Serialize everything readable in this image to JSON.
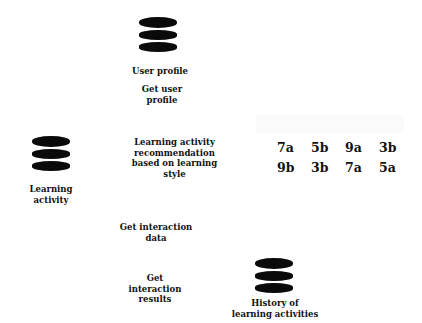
{
  "nodes": {
    "user_profile": {
      "label": "User profile"
    },
    "learning_activity": {
      "label": "Learning activity"
    },
    "history": {
      "label_line1": "History of",
      "label_line2": "learning activities"
    }
  },
  "edges": {
    "get_user_profile": {
      "line1": "Get user",
      "line2": "profile"
    },
    "recommendation": {
      "line1": "Learning activity",
      "line2": "recommendation",
      "line3": "based on learning",
      "line4": "style"
    },
    "get_interaction_data": {
      "line1": "Get interaction",
      "line2": "data"
    },
    "get_interaction_results": {
      "line1": "Get",
      "line2": "interaction",
      "line3": "results"
    }
  },
  "codes": {
    "row1": [
      "7a",
      "5b",
      "9a",
      "3b"
    ],
    "row2": [
      "9b",
      "3b",
      "7a",
      "5a"
    ]
  }
}
